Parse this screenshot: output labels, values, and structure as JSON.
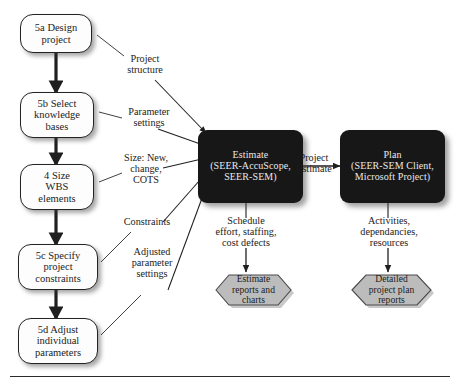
{
  "diagram": {
    "process_boxes": [
      {
        "id": "design",
        "label": "5a Design\nproject"
      },
      {
        "id": "knowledge",
        "label": "5b Select\nknowledge\nbases"
      },
      {
        "id": "size",
        "label": "4 Size\nWBS\nelements"
      },
      {
        "id": "constraints",
        "label": "5c Specify\nproject\nconstraints"
      },
      {
        "id": "adjust",
        "label": "5d Adjust\nindividual\nparameters"
      }
    ],
    "tool_boxes": [
      {
        "id": "estimate",
        "label": "Estimate\n(SEER-AccuScope,\nSEER-SEM)"
      },
      {
        "id": "plan",
        "label": "Plan\n(SEER-SEM Client,\nMicrosoft Project)"
      }
    ],
    "outputs": [
      {
        "id": "estimate-reports",
        "label": "Estimate\nreports and\ncharts"
      },
      {
        "id": "plan-reports",
        "label": "Detailed\nproject plan\nreports"
      }
    ],
    "flow_labels": [
      {
        "id": "project-structure",
        "label": "Project\nstructure"
      },
      {
        "id": "parameter-settings",
        "label": "Parameter\nsettings"
      },
      {
        "id": "size-new",
        "label": "Size: New,\nchange,\nCOTS"
      },
      {
        "id": "constraints-label",
        "label": "Constraints"
      },
      {
        "id": "adjusted-params",
        "label": "Adjusted\nparameter\nsettings"
      },
      {
        "id": "project-estimate",
        "label": "Project\nEstimate"
      },
      {
        "id": "schedule-effort",
        "label": "Schedule\neffort, staffing,\ncost defects"
      },
      {
        "id": "activities",
        "label": "Activities,\ndependancies,\nresources"
      }
    ],
    "colors": {
      "tool_box_fill": "#171717",
      "tool_box_text": "#e9e9e9",
      "process_box_fill": "#fdfdfd",
      "process_box_border": "#232323",
      "hexagon_fill": "#b9b9b9",
      "hexagon_border": "#4a4a4a",
      "connector": "#1f1f1f",
      "page_background": "#ffffff"
    }
  }
}
